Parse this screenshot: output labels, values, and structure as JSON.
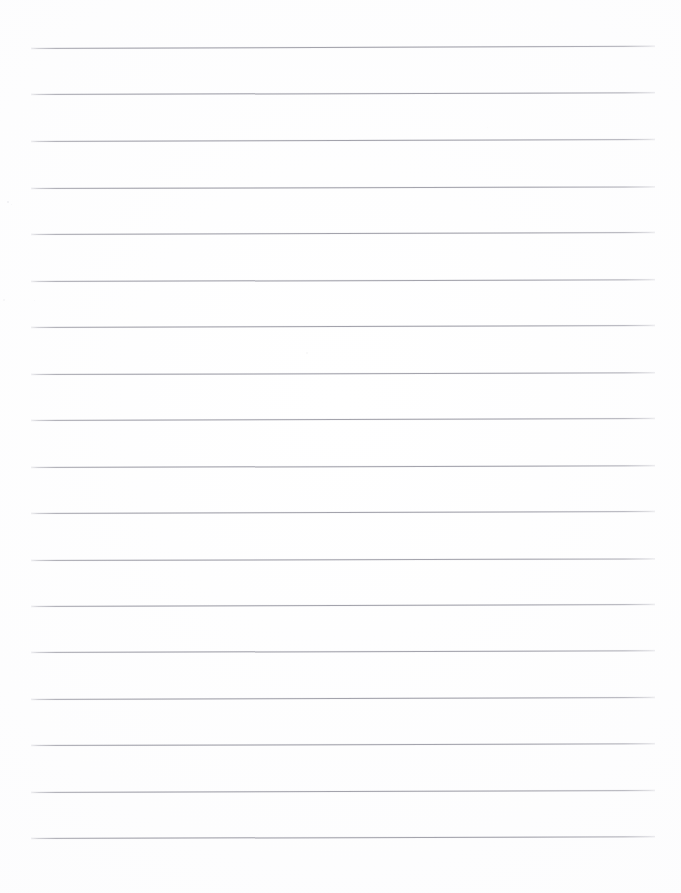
{
  "document": {
    "kind": "scanned-lined-paper",
    "title": "Blank ruled notebook page (scan)",
    "page_width": 681,
    "page_height": 893,
    "background_color": "#ffffff",
    "content_text": "",
    "handwriting_present": "none",
    "printed_text_present": "none"
  },
  "ruling": {
    "line_color": "#96969f",
    "line_thickness_px": 1,
    "line_count": 18,
    "left_edge_px": 31,
    "right_edge_px": 655,
    "line_length_px": 624,
    "first_line_y_px": 48,
    "line_spacing_px": 46.5,
    "last_line_y_px": 838,
    "skew_degrees": -0.18,
    "top_margin_px": 48,
    "bottom_margin_px": 55,
    "left_margin_px": 31,
    "right_margin_px": 26,
    "lines": [
      {
        "index": 1,
        "y": 48,
        "skew": -0.2
      },
      {
        "index": 2,
        "y": 94,
        "skew": -0.16
      },
      {
        "index": 3,
        "y": 141,
        "skew": -0.18
      },
      {
        "index": 4,
        "y": 188,
        "skew": -0.14
      },
      {
        "index": 5,
        "y": 234,
        "skew": -0.18
      },
      {
        "index": 6,
        "y": 281,
        "skew": -0.16
      },
      {
        "index": 7,
        "y": 327,
        "skew": -0.18
      },
      {
        "index": 8,
        "y": 374,
        "skew": -0.15
      },
      {
        "index": 9,
        "y": 420,
        "skew": -0.18
      },
      {
        "index": 10,
        "y": 467,
        "skew": -0.16
      },
      {
        "index": 11,
        "y": 513,
        "skew": -0.18
      },
      {
        "index": 12,
        "y": 560,
        "skew": -0.14
      },
      {
        "index": 13,
        "y": 606,
        "skew": -0.18
      },
      {
        "index": 14,
        "y": 652,
        "skew": -0.16
      },
      {
        "index": 15,
        "y": 699,
        "skew": -0.18
      },
      {
        "index": 16,
        "y": 745,
        "skew": -0.15
      },
      {
        "index": 17,
        "y": 792,
        "skew": -0.18
      },
      {
        "index": 18,
        "y": 838,
        "skew": -0.16
      }
    ]
  },
  "artifacts": {
    "specks": [
      {
        "x": 7,
        "y": 201,
        "size": 2.0,
        "opacity": 0.45
      },
      {
        "x": 11,
        "y": 204,
        "size": 1.4,
        "opacity": 0.3
      },
      {
        "x": 3,
        "y": 299,
        "size": 1.6,
        "opacity": 0.25
      },
      {
        "x": 34,
        "y": 300,
        "size": 1.3,
        "opacity": 0.2
      },
      {
        "x": 306,
        "y": 352,
        "size": 1.5,
        "opacity": 0.22
      },
      {
        "x": 529,
        "y": 233,
        "size": 1.4,
        "opacity": 0.2
      },
      {
        "x": 487,
        "y": 127,
        "size": 1.3,
        "opacity": 0.18
      }
    ]
  }
}
